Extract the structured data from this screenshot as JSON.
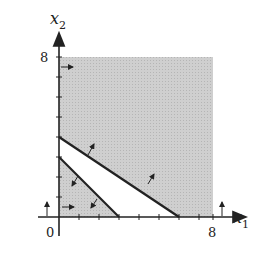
{
  "diagram": {
    "type": "linear-programming-feasible-region",
    "axes": {
      "x_label": "x",
      "x_sub": "1",
      "y_label": "x",
      "y_sub": "2",
      "origin_label": "0",
      "x_max_label": "8",
      "y_max_label": "8",
      "range": [
        0,
        8
      ]
    },
    "constraints": [
      {
        "name": "2x1 + 3x2 >= 12",
        "intercepts": {
          "x1": 6,
          "x2": 4
        },
        "direction": "above"
      },
      {
        "name": "x1 + x2 <= 3",
        "intercepts": {
          "x1": 3,
          "x2": 3
        },
        "direction": "below"
      },
      {
        "name": "x1 >= 0",
        "direction": "right"
      },
      {
        "name": "x2 >= 0",
        "direction": "up"
      }
    ],
    "colors": {
      "shade": "#c8c8c8",
      "line": "#222222",
      "background": "#ffffff"
    }
  }
}
